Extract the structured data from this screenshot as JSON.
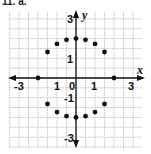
{
  "chart_data": {
    "type": "scatter",
    "title": "",
    "problem_label": "11. a.",
    "xlabel": "x",
    "ylabel": "y",
    "xlim": [
      -3,
      3
    ],
    "ylim": [
      -3,
      3
    ],
    "grid": true,
    "grid_step": 0.5,
    "x_tick_labels": [
      "-3",
      "1",
      "0",
      "1",
      "3"
    ],
    "y_tick_labels": [
      "3",
      "1",
      "-1",
      "-3"
    ],
    "series": [
      {
        "name": "points",
        "points": [
          {
            "x": -2,
            "y": 0
          },
          {
            "x": -1.5,
            "y": 1.32
          },
          {
            "x": -1,
            "y": 1.73
          },
          {
            "x": -0.5,
            "y": 1.94
          },
          {
            "x": 0,
            "y": 2
          },
          {
            "x": 0.5,
            "y": 1.94
          },
          {
            "x": 1,
            "y": 1.73
          },
          {
            "x": 1.5,
            "y": 1.32
          },
          {
            "x": 2,
            "y": 0
          },
          {
            "x": -1.5,
            "y": -1.32
          },
          {
            "x": -1,
            "y": -1.73
          },
          {
            "x": -0.5,
            "y": -1.94
          },
          {
            "x": 0,
            "y": -2
          },
          {
            "x": 0.5,
            "y": -1.94
          },
          {
            "x": 1,
            "y": -1.73
          },
          {
            "x": 1.5,
            "y": -1.32
          }
        ]
      }
    ]
  }
}
